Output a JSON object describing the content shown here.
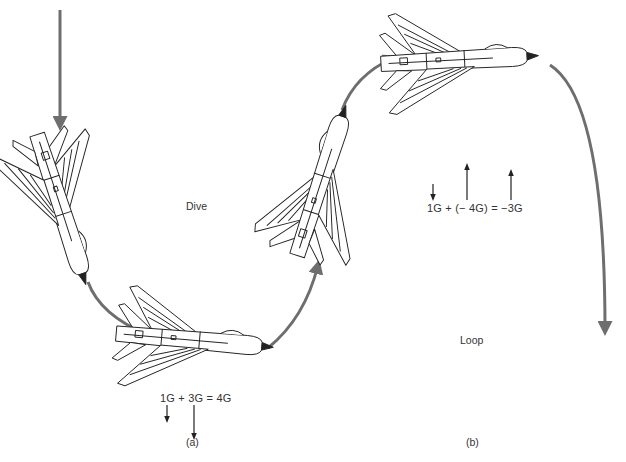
{
  "figure": {
    "panels": [
      {
        "id": "a",
        "label": "(a)",
        "maneuver": "Dive",
        "equation": "1G + 3G = 4G",
        "force_vectors": [
          {
            "term": "1G",
            "direction": "down",
            "magnitude_g": 1
          },
          {
            "term": "3G",
            "direction": "down",
            "magnitude_g": 3
          }
        ]
      },
      {
        "id": "b",
        "label": "(b)",
        "maneuver": "Loop",
        "equation": "1G + (− 4G) = −3G",
        "force_vectors": [
          {
            "term": "1G",
            "direction": "down",
            "magnitude_g": 1
          },
          {
            "term": "−4G",
            "direction": "up",
            "magnitude_g": 4
          },
          {
            "term": "−3G",
            "direction": "up",
            "magnitude_g": 3
          }
        ]
      }
    ],
    "aircraft_count": 4,
    "path_color": "#6e6e6e",
    "line_color": "#222222"
  }
}
